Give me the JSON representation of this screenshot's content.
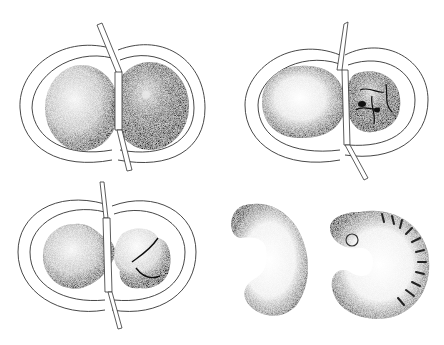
{
  "figure": {
    "panels": [
      {
        "id": "a",
        "description": "Two-lobed cell pair within double membrane, separated by rod"
      },
      {
        "id": "b",
        "description": "Smooth sphere and lobulated mass within double membrane, rod between"
      },
      {
        "id": "c",
        "description": "Sphere connected to lobed mass through membrane, rod between"
      },
      {
        "id": "d",
        "description": "Two curled stippled embryo forms, right one segmented"
      }
    ],
    "caption_visible": "",
    "colors": {
      "ink": "#1a1a1a",
      "paper": "#ffffff"
    }
  }
}
